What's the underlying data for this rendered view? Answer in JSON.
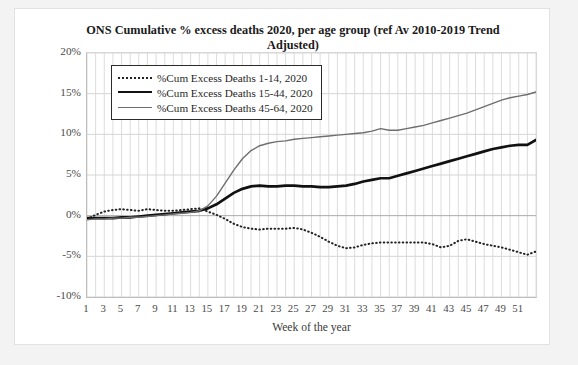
{
  "chart_data": {
    "type": "line",
    "title": "ONS Cumulative % excess deaths 2020, per age group (ref Av 2010-2019 Trend Adjusted)",
    "xlabel": "Week of the year",
    "ylabel": "Cumulative excess deaths, % of year average",
    "grid": true,
    "legend_position": "top-left-inside",
    "xlim": [
      1,
      53
    ],
    "ylim": [
      -10,
      20
    ],
    "ytick_labels": [
      "20%",
      "15%",
      "10%",
      "5%",
      "0%",
      "-5%",
      "-10%"
    ],
    "ytick_values": [
      20,
      15,
      10,
      5,
      0,
      -5,
      -10
    ],
    "xtick_labels": [
      "1",
      "3",
      "5",
      "7",
      "9",
      "11",
      "13",
      "15",
      "17",
      "19",
      "21",
      "23",
      "25",
      "27",
      "29",
      "31",
      "33",
      "35",
      "37",
      "39",
      "41",
      "43",
      "45",
      "47",
      "49",
      "51"
    ],
    "xtick_values": [
      1,
      3,
      5,
      7,
      9,
      11,
      13,
      15,
      17,
      19,
      21,
      23,
      25,
      27,
      29,
      31,
      33,
      35,
      37,
      39,
      41,
      43,
      45,
      47,
      49,
      51
    ],
    "x": [
      1,
      2,
      3,
      4,
      5,
      6,
      7,
      8,
      9,
      10,
      11,
      12,
      13,
      14,
      15,
      16,
      17,
      18,
      19,
      20,
      21,
      22,
      23,
      24,
      25,
      26,
      27,
      28,
      29,
      30,
      31,
      32,
      33,
      34,
      35,
      36,
      37,
      38,
      39,
      40,
      41,
      42,
      43,
      44,
      45,
      46,
      47,
      48,
      49,
      50,
      51,
      52,
      53
    ],
    "series": [
      {
        "name": "%Cum Excess Deaths 1-14, 2020",
        "style": "dotted",
        "color": "#222222",
        "values": [
          -0.4,
          0.1,
          0.5,
          0.7,
          0.8,
          0.7,
          0.6,
          0.8,
          0.7,
          0.6,
          0.6,
          0.7,
          0.8,
          0.9,
          0.5,
          0.1,
          -0.4,
          -1.0,
          -1.4,
          -1.6,
          -1.7,
          -1.6,
          -1.6,
          -1.6,
          -1.5,
          -1.7,
          -2.1,
          -2.6,
          -3.2,
          -3.7,
          -4.0,
          -3.9,
          -3.6,
          -3.4,
          -3.3,
          -3.3,
          -3.3,
          -3.3,
          -3.3,
          -3.3,
          -3.5,
          -3.9,
          -3.7,
          -3.1,
          -2.9,
          -3.2,
          -3.5,
          -3.7,
          -3.9,
          -4.2,
          -4.5,
          -4.8,
          -4.4
        ]
      },
      {
        "name": "%Cum Excess Deaths 15-44, 2020",
        "style": "thick-solid",
        "color": "#111111",
        "values": [
          -0.3,
          -0.3,
          -0.3,
          -0.3,
          -0.2,
          -0.2,
          -0.1,
          0.0,
          0.1,
          0.2,
          0.3,
          0.4,
          0.5,
          0.6,
          0.9,
          1.4,
          2.1,
          2.8,
          3.3,
          3.6,
          3.7,
          3.6,
          3.6,
          3.7,
          3.7,
          3.6,
          3.6,
          3.5,
          3.5,
          3.6,
          3.7,
          3.9,
          4.2,
          4.4,
          4.6,
          4.6,
          4.9,
          5.2,
          5.5,
          5.8,
          6.1,
          6.4,
          6.7,
          7.0,
          7.3,
          7.6,
          7.9,
          8.2,
          8.4,
          8.6,
          8.7,
          8.7,
          9.3
        ]
      },
      {
        "name": "%Cum Excess Deaths 45-64, 2020",
        "style": "thin-solid",
        "color": "#6e6e6e",
        "values": [
          -0.5,
          -0.4,
          -0.4,
          -0.3,
          -0.3,
          -0.2,
          -0.2,
          -0.1,
          0.0,
          0.1,
          0.2,
          0.3,
          0.4,
          0.6,
          1.2,
          2.4,
          4.0,
          5.6,
          7.0,
          8.0,
          8.6,
          8.9,
          9.1,
          9.2,
          9.4,
          9.5,
          9.6,
          9.7,
          9.8,
          9.9,
          10.0,
          10.1,
          10.2,
          10.4,
          10.7,
          10.5,
          10.5,
          10.7,
          10.9,
          11.1,
          11.4,
          11.7,
          12.0,
          12.3,
          12.6,
          13.0,
          13.4,
          13.8,
          14.2,
          14.5,
          14.7,
          14.9,
          15.2
        ]
      }
    ]
  }
}
